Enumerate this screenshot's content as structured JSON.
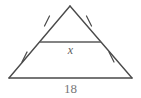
{
  "figure": {
    "shape": "triangle",
    "stroke_color": "#4a4a4a",
    "midsegment_color": "#5a5a5a",
    "text_color": "#6e6e6e",
    "background_color": "#ffffff",
    "labels": {
      "midsegment": "x",
      "base": "18"
    },
    "tick_marks": {
      "count": 4,
      "description": "single congruence tick on each half of both legs"
    },
    "vertices": {
      "apex": [
        70,
        6
      ],
      "bottom_left": [
        9,
        78
      ],
      "bottom_right": [
        132,
        78
      ]
    },
    "midsegment_endpoints": {
      "left": [
        39,
        42
      ],
      "right": [
        101,
        42
      ]
    }
  }
}
